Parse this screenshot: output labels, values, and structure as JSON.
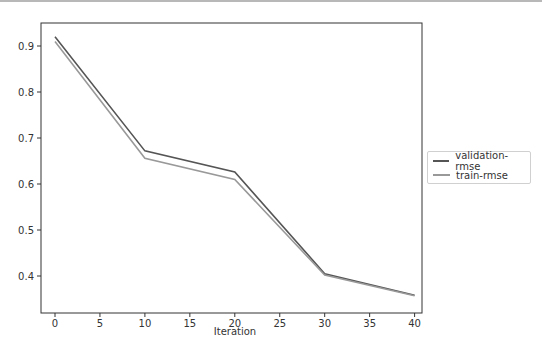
{
  "chart_data": {
    "type": "line",
    "title": "",
    "xlabel": "Iteration",
    "ylabel": "",
    "x": [
      0,
      10,
      20,
      30,
      40
    ],
    "series": [
      {
        "name": "validation-rmse",
        "color": "#555555",
        "values": [
          0.92,
          0.672,
          0.626,
          0.405,
          0.358
        ]
      },
      {
        "name": "train-rmse",
        "color": "#999999",
        "values": [
          0.91,
          0.656,
          0.61,
          0.402,
          0.357
        ]
      }
    ],
    "xlim": [
      -1.5,
      41.5
    ],
    "ylim": [
      0.33,
      0.95
    ],
    "xticks": [
      "0",
      "5",
      "10",
      "15",
      "20",
      "25",
      "30",
      "35",
      "40"
    ],
    "yticks": [
      "0.9",
      "0.8",
      "0.7",
      "0.6",
      "0.5",
      "0.4"
    ],
    "grid": false,
    "legend_position": "outside right center"
  },
  "legend": {
    "items": [
      {
        "label": "validation-rmse",
        "color": "#555555"
      },
      {
        "label": "train-rmse",
        "color": "#999999"
      }
    ]
  },
  "axes": {
    "xlabel": "Iteration",
    "xticks": [
      "0",
      "5",
      "10",
      "15",
      "20",
      "25",
      "30",
      "35",
      "40"
    ],
    "yticks": [
      "0.9",
      "0.8",
      "0.7",
      "0.6",
      "0.5",
      "0.4"
    ]
  }
}
